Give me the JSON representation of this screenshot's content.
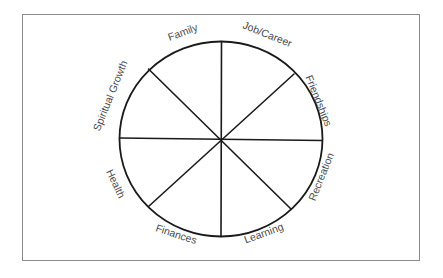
{
  "diagram": {
    "type": "wheel-of-life",
    "segments": 8,
    "labels": [
      {
        "key": "family",
        "text": "Family",
        "x": 183,
        "y": 33,
        "rotate": -20
      },
      {
        "key": "job-career",
        "text": "Job/Career",
        "x": 267,
        "y": 35,
        "rotate": 22
      },
      {
        "key": "friendships",
        "text": "Friendships",
        "x": 318,
        "y": 101,
        "rotate": 68
      },
      {
        "key": "recreation",
        "text": "Recreation",
        "x": 322,
        "y": 177,
        "rotate": -68
      },
      {
        "key": "learning",
        "text": "Learning",
        "x": 264,
        "y": 234,
        "rotate": -20
      },
      {
        "key": "finances",
        "text": "Finances",
        "x": 176,
        "y": 235,
        "rotate": 18
      },
      {
        "key": "health",
        "text": "Health",
        "x": 115,
        "y": 184,
        "rotate": 65
      },
      {
        "key": "spiritual-growth",
        "text": "Spiritual Growth",
        "x": 111,
        "y": 96,
        "rotate": -68
      }
    ],
    "colors": {
      "line": "#1a1a1a",
      "label": "#4a4a4a",
      "frame": "#8a8a8a",
      "background": "#ffffff"
    }
  }
}
